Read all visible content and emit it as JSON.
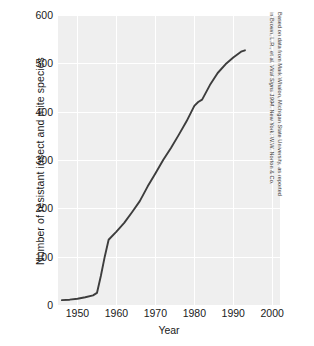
{
  "chart_data": {
    "type": "line",
    "title": "",
    "xlabel": "Year",
    "ylabel": "Number of resistant insect and mite species",
    "xlim": [
      1945,
      2002
    ],
    "ylim": [
      0,
      600
    ],
    "grid": true,
    "legend": false,
    "x_ticks": [
      1950,
      1960,
      1970,
      1980,
      1990,
      2000
    ],
    "y_ticks": [
      0,
      100,
      200,
      300,
      400,
      500,
      600
    ],
    "series": [
      {
        "name": "Resistant insect and mite species",
        "color": "#3d3d3d",
        "x": [
          1946,
          1948,
          1950,
          1952,
          1954,
          1955,
          1956,
          1957,
          1958,
          1960,
          1962,
          1964,
          1966,
          1968,
          1970,
          1972,
          1974,
          1976,
          1978,
          1980,
          1981,
          1982,
          1984,
          1986,
          1988,
          1990,
          1992,
          1993
        ],
        "values": [
          10,
          11,
          13,
          16,
          20,
          25,
          60,
          100,
          135,
          152,
          170,
          192,
          215,
          245,
          272,
          300,
          325,
          352,
          380,
          412,
          420,
          425,
          455,
          480,
          498,
          512,
          524,
          527
        ]
      }
    ]
  },
  "axes": {
    "y_tick_labels": [
      "600",
      "500",
      "400",
      "300",
      "200",
      "100",
      "0"
    ],
    "x_tick_labels": [
      "1950",
      "1960",
      "1970",
      "1980",
      "1990",
      "2000"
    ],
    "x_title": "Year",
    "y_title": "Number of resistant insect and mite species"
  },
  "credit": {
    "line1": "Based on data from Mark Whalon, Michigan State University, as reported",
    "line2_a": "in Brown, L.R., et al. ",
    "line2_b": "Vital Signs 1994",
    "line2_c": ". New York: W.W. Norton & Co."
  },
  "colors": {
    "plot_background": "#efefef",
    "gridline": "#ffffff",
    "line": "#3d3d3d",
    "text": "#1a1a1a",
    "credit_text": "#3a3a3a"
  }
}
